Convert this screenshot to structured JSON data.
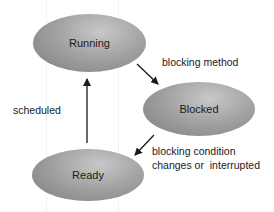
{
  "diagram": {
    "type": "state-transition",
    "nodes": [
      {
        "id": "running",
        "label": "Running"
      },
      {
        "id": "blocked",
        "label": "Blocked"
      },
      {
        "id": "ready",
        "label": "Ready"
      }
    ],
    "edges": [
      {
        "from": "running",
        "to": "blocked",
        "label": "blocking method"
      },
      {
        "from": "blocked",
        "to": "ready",
        "label_line1": "blocking condition",
        "label_line2": "changes or  interrupted"
      },
      {
        "from": "ready",
        "to": "running",
        "label": "scheduled"
      }
    ],
    "colors": {
      "node_fill": "#9a9a9a",
      "text": "#1a1a1a",
      "arrow": "#1a1a1a",
      "background": "#ffffff"
    }
  }
}
